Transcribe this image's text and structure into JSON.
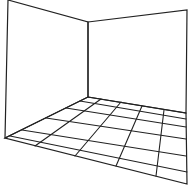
{
  "diagram": {
    "stroke_color": "#222222",
    "background": "#ffffff",
    "walls": {
      "left_wall": [
        [
          8,
          0
        ],
        [
          88,
          22
        ],
        [
          88,
          97
        ],
        [
          5,
          138
        ]
      ],
      "right_wall": [
        [
          88,
          22
        ],
        [
          187,
          10
        ],
        [
          186,
          113
        ],
        [
          88,
          97
        ]
      ]
    },
    "floor": {
      "outline": [
        [
          88,
          97
        ],
        [
          186,
          113
        ],
        [
          187,
          184
        ],
        [
          5,
          138
        ]
      ],
      "row_lines": [
        [
          [
            80,
            101
          ],
          [
            186,
            119
          ]
        ],
        [
          [
            66,
            108
          ],
          [
            186,
            127
          ]
        ],
        [
          [
            46,
            118
          ],
          [
            186,
            139
          ]
        ],
        [
          [
            22,
            130
          ],
          [
            186,
            156
          ]
        ],
        [
          [
            10,
            136
          ],
          [
            187,
            172
          ]
        ]
      ],
      "column_lines": [
        [
          [
            101,
            99
          ],
          [
            35,
            146
          ]
        ],
        [
          [
            121,
            102
          ],
          [
            75,
            156
          ]
        ],
        [
          [
            142,
            106
          ],
          [
            116,
            166
          ]
        ],
        [
          [
            164,
            110
          ],
          [
            156,
            176
          ]
        ]
      ]
    }
  }
}
